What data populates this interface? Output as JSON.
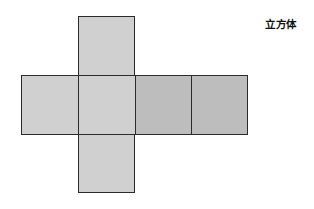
{
  "diagram": {
    "title": "立方体",
    "type": "cube-net",
    "colors": {
      "face_light": "#d0d0d0",
      "face_dark": "#bdbdbd",
      "border": "#2b2b2b",
      "background": "#ffffff"
    },
    "faces": [
      {
        "id": "top",
        "x": 78,
        "y": 16,
        "w": 57,
        "h": 59,
        "shade": "light"
      },
      {
        "id": "left",
        "x": 21,
        "y": 75,
        "w": 58,
        "h": 59,
        "shade": "light"
      },
      {
        "id": "front",
        "x": 78,
        "y": 75,
        "w": 57,
        "h": 59,
        "shade": "light"
      },
      {
        "id": "right",
        "x": 134,
        "y": 75,
        "w": 58,
        "h": 59,
        "shade": "dark"
      },
      {
        "id": "back",
        "x": 191,
        "y": 75,
        "w": 57,
        "h": 59,
        "shade": "dark"
      },
      {
        "id": "bottom",
        "x": 78,
        "y": 133,
        "w": 57,
        "h": 60,
        "shade": "light"
      }
    ]
  }
}
